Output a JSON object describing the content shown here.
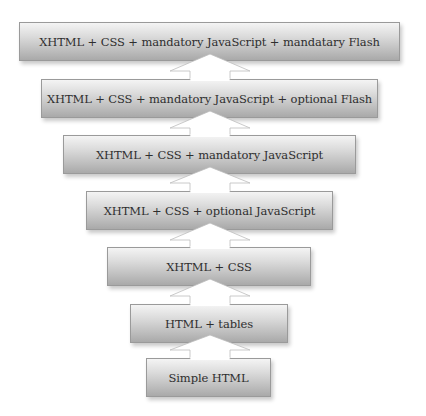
{
  "diagram": {
    "type": "stacked-progression",
    "direction": "bottom-to-top",
    "layers": [
      {
        "id": "layer-1",
        "label": "XHTML + CSS + mandatory JavaScript + mandatary Flash"
      },
      {
        "id": "layer-2",
        "label": "XHTML + CSS + mandatory JavaScript + optional Flash"
      },
      {
        "id": "layer-3",
        "label": "XHTML + CSS + mandatory JavaScript"
      },
      {
        "id": "layer-4",
        "label": "XHTML + CSS +  optional JavaScript"
      },
      {
        "id": "layer-5",
        "label": "XHTML + CSS"
      },
      {
        "id": "layer-6",
        "label": "HTML + tables"
      },
      {
        "id": "layer-7",
        "label": "Simple HTML"
      }
    ],
    "connector": "up-arrow-icon",
    "colors": {
      "box_top": "#f4f4f4",
      "box_bottom": "#a9a9a9",
      "box_border": "#9a9a9a",
      "text": "#2e2e2e",
      "arrow_fill": "#ffffff",
      "arrow_stroke": "#bdbdbd"
    }
  }
}
